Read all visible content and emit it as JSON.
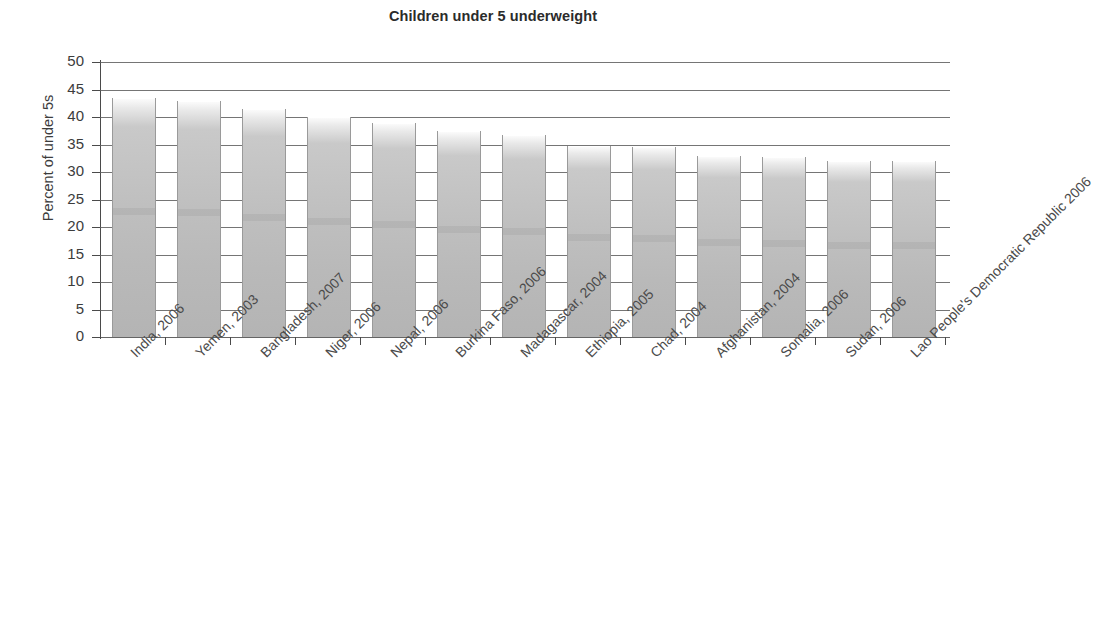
{
  "chart_data": {
    "type": "bar",
    "title": "Children under 5 underweight",
    "xlabel": "",
    "ylabel": "Percent of under 5s",
    "ylim": [
      0,
      50
    ],
    "ytick_step": 5,
    "yticks": [
      "50",
      "45",
      "40",
      "35",
      "30",
      "25",
      "20",
      "15",
      "10",
      "5",
      "0"
    ],
    "grid": true,
    "legend": false,
    "categories": [
      "India, 2006",
      "Yemen, 2003",
      "Bangladesh, 2007",
      "Niger, 2006",
      "Nepal, 2006",
      "Burkina Faso, 2006",
      "Madagascar, 2004",
      "Ethiopia, 2005",
      "Chad, 2004",
      "Afghanistan, 2004",
      "Somalia, 2006",
      "Sudan, 2006",
      "Lao People's Democratic Republic 2006"
    ],
    "values": [
      43.5,
      43,
      41.5,
      40,
      39,
      37.5,
      36.8,
      34.8,
      34.5,
      33,
      32.8,
      32,
      32
    ],
    "bar_color": "#c0c0c0",
    "axis_color": "#4a4a4a",
    "title_color": "#2b2b2b"
  }
}
